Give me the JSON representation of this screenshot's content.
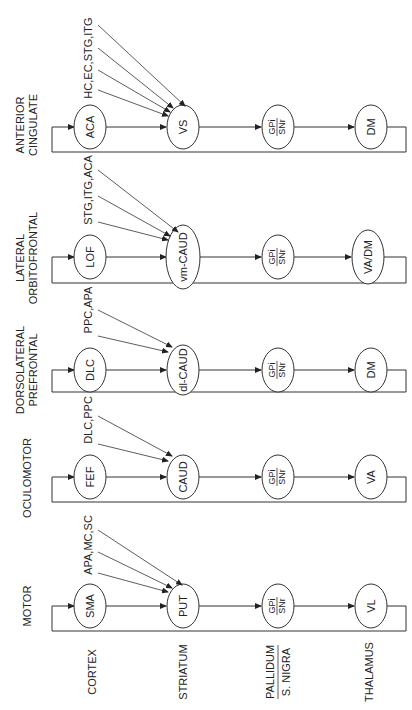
{
  "diagram": {
    "orientation": "rotated-90-ccw",
    "loops": [
      {
        "id": "motor",
        "title_lines": [
          "MOTOR"
        ],
        "cortex": "SMA",
        "striatum": "PUT",
        "pallidum_top": "GPi",
        "pallidum_bottom": "SNr",
        "thalamus": "VL",
        "inputs_label": "APA,MC,SC",
        "input_count": 3
      },
      {
        "id": "oculomotor",
        "title_lines": [
          "OCULOMOTOR"
        ],
        "cortex": "FEF",
        "striatum": "CAUD",
        "pallidum_top": "GPi",
        "pallidum_bottom": "SNr",
        "thalamus": "VA",
        "inputs_label": "DLC,PPC",
        "input_count": 2
      },
      {
        "id": "dorsolateral-prefrontal",
        "title_lines": [
          "DORSOLATERAL",
          "PREFRONTAL"
        ],
        "cortex": "DLC",
        "striatum": "dl-CAUD",
        "pallidum_top": "GPi",
        "pallidum_bottom": "SNr",
        "thalamus": "DM",
        "inputs_label": "PPC,APA",
        "input_count": 2
      },
      {
        "id": "lateral-orbitofrontal",
        "title_lines": [
          "LATERAL",
          "ORBITOFRONTAL"
        ],
        "cortex": "LOF",
        "striatum": "vm-CAUD",
        "pallidum_top": "GPi",
        "pallidum_bottom": "SNr",
        "thalamus": "VA/DM",
        "inputs_label": "STG,ITG,ACA",
        "input_count": 3
      },
      {
        "id": "anterior-cingulate",
        "title_lines": [
          "ANTERIOR",
          "CINGULATE"
        ],
        "cortex": "ACA",
        "striatum": "VS",
        "pallidum_top": "GPi",
        "pallidum_bottom": "SNr",
        "thalamus": "DM",
        "inputs_label": "HC,EC,STG,ITG",
        "input_count": 4
      }
    ],
    "stage_labels": {
      "cortex": "CORTEX",
      "striatum": "STRIATUM",
      "pallidum_top": "PALLIDUM",
      "pallidum_bottom": "S. NIGRA",
      "thalamus": "THALAMUS"
    },
    "colors": {
      "line": "#333333",
      "text": "#222222",
      "background": "#ffffff"
    }
  }
}
